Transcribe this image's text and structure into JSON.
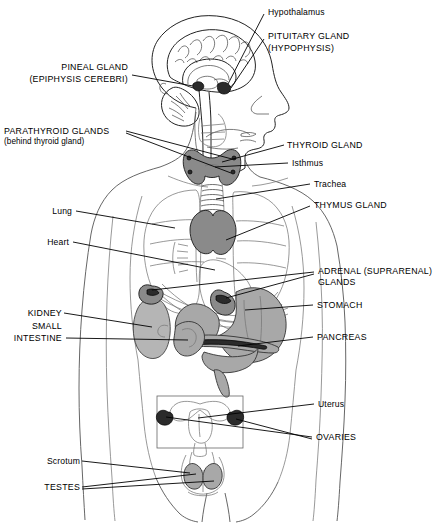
{
  "figure": {
    "view": "anterior body outline with midsagittal head section"
  },
  "labels": {
    "hypothalamus": "Hypothalamus",
    "pituitary_line1": "PITUITARY GLAND",
    "pituitary_line2": "(HYPOPHYSIS)",
    "pineal_line1": "PINEAL GLAND",
    "pineal_line2": "(EPIPHYSIS CEREBRI)",
    "parathyroid_line1": "PARATHYROID GLANDS",
    "parathyroid_line2": "(behind thyroid gland)",
    "thyroid": "THYROID GLAND",
    "isthmus": "Isthmus",
    "trachea": "Trachea",
    "thymus": "THYMUS GLAND",
    "lung": "Lung",
    "heart": "Heart",
    "adrenal_line1": "ADRENAL (SUPRARENAL)",
    "adrenal_line2": "GLANDS",
    "stomach": "STOMACH",
    "kidney": "KIDNEY",
    "small_intestine_line1": "SMALL",
    "small_intestine_line2": "INTESTINE",
    "pancreas": "PANCREAS",
    "uterus": "Uterus",
    "ovaries": "OVARIES",
    "scrotum": "Scrotum",
    "testes": "TESTES"
  },
  "colors": {
    "background": "#ffffff",
    "ink": "#000000",
    "outline": "#555555",
    "organ_gray": "#a8a8a8",
    "gland_dark": "#2b2b2b"
  }
}
